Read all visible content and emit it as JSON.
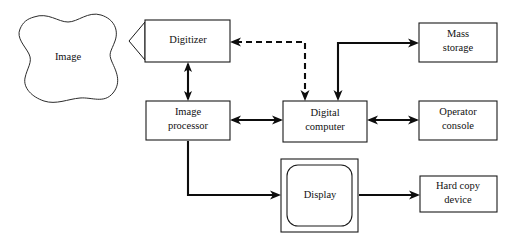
{
  "diagram": {
    "canvas": {
      "width": 517,
      "height": 242,
      "background": "#ffffff"
    },
    "line_color": "#0d0d0d",
    "text_color": "#111111",
    "nodes": [
      {
        "id": "image",
        "label": "Image",
        "shape": "blob",
        "x": 16,
        "y": 14,
        "w": 104,
        "h": 86
      },
      {
        "id": "digitizer",
        "label": "Digitizer",
        "shape": "rect",
        "x": 145,
        "y": 20,
        "w": 85,
        "h": 42
      },
      {
        "id": "image-processor",
        "label_line1": "Image",
        "label_line2": "processor",
        "shape": "rect",
        "x": 146,
        "y": 101,
        "w": 84,
        "h": 39
      },
      {
        "id": "digital-computer",
        "label_line1": "Digital",
        "label_line2": "computer",
        "shape": "rect",
        "x": 283,
        "y": 101,
        "w": 84,
        "h": 41
      },
      {
        "id": "mass-storage",
        "label_line1": "Mass",
        "label_line2": "storage",
        "shape": "rect",
        "x": 419,
        "y": 23,
        "w": 78,
        "h": 39
      },
      {
        "id": "operator-console",
        "label_line1": "Operator",
        "label_line2": "console",
        "shape": "rect",
        "x": 419,
        "y": 101,
        "w": 78,
        "h": 39
      },
      {
        "id": "display",
        "label": "Display",
        "shape": "crt",
        "x": 281,
        "y": 159,
        "w": 77,
        "h": 73
      },
      {
        "id": "hard-copy-device",
        "label_line1": "Hard copy",
        "label_line2": "device",
        "shape": "rect",
        "x": 420,
        "y": 176,
        "w": 77,
        "h": 36
      }
    ],
    "connections": [
      {
        "id": "lens-to-digitizer",
        "style": "shape",
        "from": "image",
        "to": "digitizer",
        "arrow": "none"
      },
      {
        "id": "digitizer-to-image-processor",
        "style": "solid",
        "from": "digitizer",
        "to": "image-processor",
        "arrow": "both"
      },
      {
        "id": "digitizer-digital-computer",
        "style": "dashed",
        "from": "digital-computer",
        "to": "digitizer",
        "arrow": "both"
      },
      {
        "id": "digital-computer-to-mass-storage",
        "style": "solid",
        "from": "digital-computer",
        "to": "mass-storage",
        "arrow": "both"
      },
      {
        "id": "image-processor-digital-computer",
        "style": "solid",
        "from": "image-processor",
        "to": "digital-computer",
        "arrow": "both"
      },
      {
        "id": "digital-computer-operator-console",
        "style": "solid",
        "from": "digital-computer",
        "to": "operator-console",
        "arrow": "both"
      },
      {
        "id": "image-processor-to-display",
        "style": "solid",
        "from": "image-processor",
        "to": "display",
        "arrow": "end"
      },
      {
        "id": "display-to-hard-copy",
        "style": "solid",
        "from": "display",
        "to": "hard-copy-device",
        "arrow": "end"
      }
    ]
  }
}
